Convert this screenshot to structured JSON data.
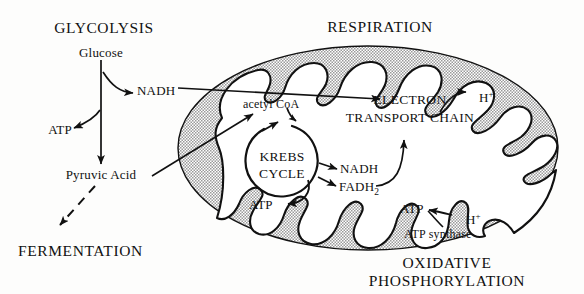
{
  "diagram": {
    "background_color": "#fdfdfc",
    "ink_color": "#111111",
    "matrix_fill": "#ffffff",
    "cytoplasm_fill": "#d6d6d6"
  },
  "headings": {
    "glycolysis": "GLYCOLYSIS",
    "respiration": "RESPIRATION",
    "fermentation": "FERMENTATION",
    "oxidative_line1": "OXIDATIVE",
    "oxidative_line2": "PHOSPHORYLATION"
  },
  "glycolysis": {
    "glucose": "Glucose",
    "nadh": "NADH",
    "atp": "ATP",
    "pyruvic_acid": "Pyruvic Acid"
  },
  "mitochondrion": {
    "acetyl_coa": "acetyl CoA",
    "krebs_line1": "KREBS",
    "krebs_line2": "CYCLE",
    "krebs_atp": "ATP",
    "nadh": "NADH",
    "fadh2_base": "FADH",
    "fadh2_sub": "2",
    "etc_line1": "ELECTRON",
    "etc_line2": "TRANSPORT CHAIN",
    "proton_base": "H",
    "proton_sup": "+",
    "atp_synthase": "ATP synthase",
    "synthase_atp": "ATP"
  }
}
